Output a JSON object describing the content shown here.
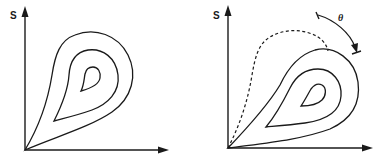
{
  "figure": {
    "panels": [
      {
        "id": "left",
        "y_axis_label": "S",
        "x_axis_label": "",
        "contours": [
          "outer",
          "middle",
          "inner"
        ],
        "has_dashed_contour": false
      },
      {
        "id": "right",
        "y_axis_label": "S",
        "x_axis_label": "",
        "contours": [
          "outer",
          "middle",
          "inner"
        ],
        "has_dashed_contour": true,
        "rotation_annotation": {
          "symbol": "θ",
          "description": "curved arrow indicating rotation angle"
        }
      }
    ],
    "colors": {
      "ink": "#1a1a1a",
      "background": "#ffffff"
    }
  }
}
